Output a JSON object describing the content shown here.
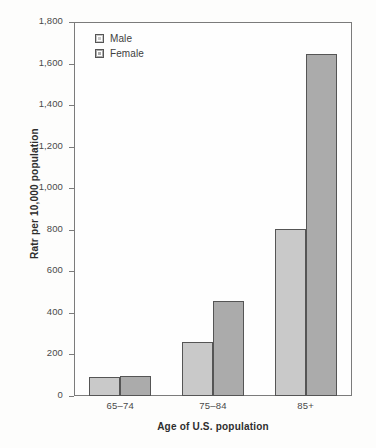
{
  "chart_data": {
    "type": "bar",
    "title": "",
    "subtitle": "",
    "xlabel": "Age of U.S. population",
    "ylabel": "Ratr per 10,000 population",
    "categories": [
      "65–74",
      "75–84",
      "85+"
    ],
    "series": [
      {
        "name": "Male",
        "color": "#c9c9c9",
        "values": [
          90,
          262,
          802
        ]
      },
      {
        "name": "Female",
        "color": "#ababab",
        "values": [
          98,
          458,
          1648
        ]
      }
    ],
    "ylim": [
      0,
      1800
    ],
    "ytick_step": 200,
    "ytick_labels": [
      "0",
      "200",
      "400",
      "600",
      "800",
      "1,000",
      "1,200",
      "1,400",
      "1,600",
      "1,800"
    ],
    "ytick_values": [
      0,
      200,
      400,
      600,
      800,
      1000,
      1200,
      1400,
      1600,
      1800
    ],
    "grid": false,
    "legend_position": "top-left",
    "bar_border_color": "#555555",
    "frame_color": "#7b7b7b",
    "background": "#fdfdfc"
  },
  "legend": {
    "items": [
      {
        "label": "Male",
        "swatch": "legend-swatch-male"
      },
      {
        "label": "Female",
        "swatch": "legend-swatch-female"
      }
    ]
  }
}
